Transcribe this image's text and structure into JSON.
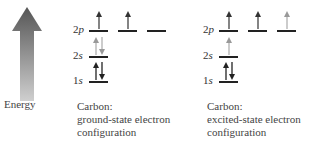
{
  "axis": {
    "label": "Energy",
    "gradient_top": "#555555",
    "gradient_bottom": "#c8c8c8"
  },
  "ground": {
    "labels": {
      "p": "2p",
      "s2": "2s",
      "s1": "1s"
    },
    "caption": {
      "line1": "Carbon:",
      "line2": "ground-state electron",
      "line3": "configuration"
    },
    "orbitals": [
      {
        "name": "1s",
        "electrons": "up,down"
      },
      {
        "name": "2s",
        "electrons": "up,down"
      },
      {
        "name": "2p-a",
        "electrons": "up"
      },
      {
        "name": "2p-b",
        "electrons": "up"
      },
      {
        "name": "2p-c",
        "electrons": ""
      }
    ]
  },
  "excited": {
    "labels": {
      "p": "2p",
      "s2": "2s",
      "s1": "1s"
    },
    "caption": {
      "line1": "Carbon:",
      "line2": "excited-state electron",
      "line3": "configuration"
    },
    "orbitals": [
      {
        "name": "1s",
        "electrons": "up,down"
      },
      {
        "name": "2s",
        "electrons": "up"
      },
      {
        "name": "2p-a",
        "electrons": "up"
      },
      {
        "name": "2p-b",
        "electrons": "up"
      },
      {
        "name": "2p-c",
        "electrons": "up"
      }
    ]
  }
}
